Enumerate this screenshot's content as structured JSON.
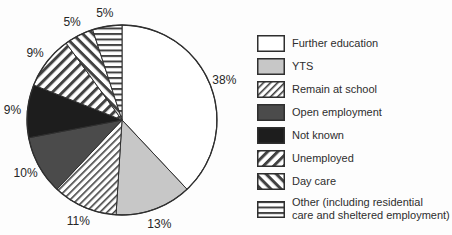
{
  "colors": {
    "background": "#fdfdfd",
    "outline": "#2f2f2f",
    "label_text": "#262626",
    "legend_text": "#2e2e2e",
    "further_education_white": "#ffffff",
    "yts_gray": "#c7c7c7",
    "open_employment_gray": "#4b4b4b",
    "not_known_black": "#1d1d1d",
    "pattern_stripe": "#424242",
    "pattern_bg": "#ffffff"
  },
  "chart_data": {
    "type": "pie",
    "start_angle_deg": 0,
    "direction": "clockwise",
    "legend_position": "right",
    "series": [
      {
        "label": "Further education",
        "value": 38,
        "pct_label": "38%",
        "fill": "white"
      },
      {
        "label": "YTS",
        "value": 13,
        "pct_label": "13%",
        "fill": "lightgray"
      },
      {
        "label": "Remain at school",
        "value": 11,
        "pct_label": "11%",
        "fill": "hatch-thin"
      },
      {
        "label": "Open employment",
        "value": 10,
        "pct_label": "10%",
        "fill": "darkgray"
      },
      {
        "label": "Not known",
        "value": 9,
        "pct_label": "9%",
        "fill": "black"
      },
      {
        "label": "Unemployed",
        "value": 9,
        "pct_label": "9%",
        "fill": "stripe-fwd"
      },
      {
        "label": "Day care",
        "value": 5,
        "pct_label": "5%",
        "fill": "stripe-back"
      },
      {
        "label": "Other (including residential care and sheltered employment)",
        "value": 5,
        "pct_label": "5%",
        "fill": "stripe-horiz"
      }
    ]
  },
  "legend": {
    "items": [
      {
        "fill": "white",
        "lines": [
          "Further education"
        ]
      },
      {
        "fill": "lightgray",
        "lines": [
          "YTS"
        ]
      },
      {
        "fill": "hatch-thin",
        "lines": [
          "Remain at school"
        ]
      },
      {
        "fill": "darkgray",
        "lines": [
          "Open employment"
        ]
      },
      {
        "fill": "black",
        "lines": [
          "Not known"
        ]
      },
      {
        "fill": "stripe-fwd",
        "lines": [
          "Unemployed"
        ]
      },
      {
        "fill": "stripe-back",
        "lines": [
          "Day care"
        ]
      },
      {
        "fill": "stripe-horiz",
        "lines": [
          "Other (including residential",
          "care and sheltered employment)"
        ]
      }
    ]
  }
}
